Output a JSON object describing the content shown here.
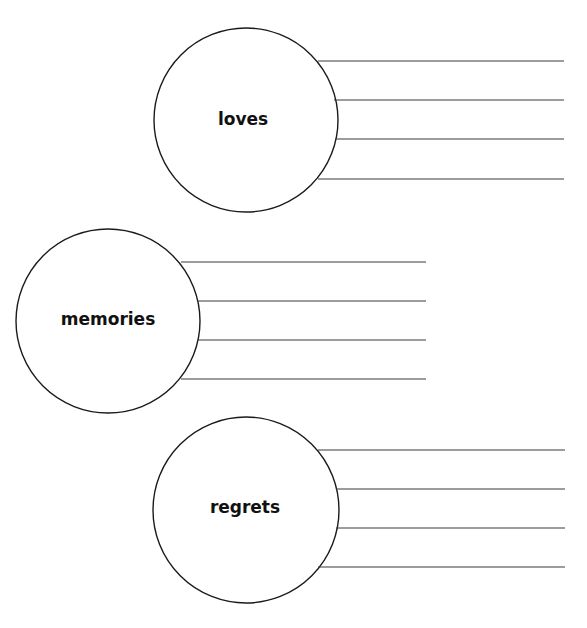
{
  "worksheet": {
    "groups": [
      {
        "label": "loves",
        "circle": {
          "cx": 246,
          "cy": 120,
          "r": 92
        },
        "lines": [
          {
            "y": 61,
            "x1": 318,
            "x2": 564
          },
          {
            "y": 100,
            "x1": 334,
            "x2": 564
          },
          {
            "y": 139,
            "x1": 335,
            "x2": 564
          },
          {
            "y": 179,
            "x1": 318,
            "x2": 564
          }
        ]
      },
      {
        "label": "memories",
        "circle": {
          "cx": 108,
          "cy": 321,
          "r": 92
        },
        "lines": [
          {
            "y": 262,
            "x1": 181,
            "x2": 426
          },
          {
            "y": 301,
            "x1": 197,
            "x2": 426
          },
          {
            "y": 340,
            "x1": 197,
            "x2": 426
          },
          {
            "y": 379,
            "x1": 181,
            "x2": 426
          }
        ]
      },
      {
        "label": "regrets",
        "circle": {
          "cx": 246,
          "cy": 510,
          "r": 93
        },
        "lines": [
          {
            "y": 450,
            "x1": 318,
            "x2": 565
          },
          {
            "y": 489,
            "x1": 336,
            "x2": 565
          },
          {
            "y": 528,
            "x1": 336,
            "x2": 565
          },
          {
            "y": 567,
            "x1": 318,
            "x2": 565
          }
        ]
      }
    ]
  }
}
